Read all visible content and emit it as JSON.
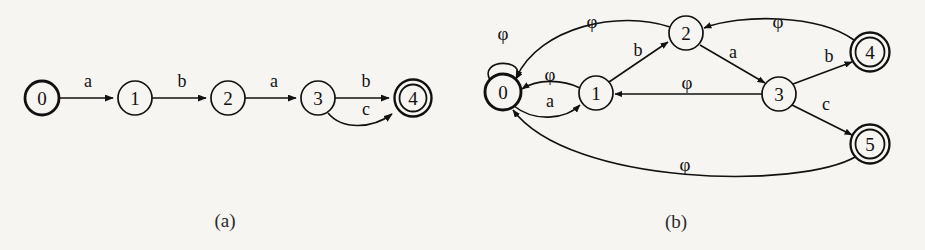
{
  "figure": {
    "background_color": "#f6f5f1",
    "ink_color": "#111111",
    "captions": [
      {
        "id": "caption-a",
        "text": "(a)",
        "x": 225,
        "y": 220
      },
      {
        "id": "caption-b",
        "text": "(b)",
        "x": 676,
        "y": 221
      }
    ]
  },
  "diagram_a": {
    "name": "nfa-chain-a",
    "caption": "(a)",
    "states": [
      {
        "id": "a0",
        "label": "0",
        "x": 42,
        "y": 98,
        "r": 17,
        "accepting": false,
        "start": true,
        "bold": true
      },
      {
        "id": "a1",
        "label": "1",
        "x": 135,
        "y": 98,
        "r": 17,
        "accepting": false,
        "start": false,
        "bold": false
      },
      {
        "id": "a2",
        "label": "2",
        "x": 228,
        "y": 98,
        "r": 17,
        "accepting": false,
        "start": false,
        "bold": false
      },
      {
        "id": "a3",
        "label": "3",
        "x": 318,
        "y": 98,
        "r": 17,
        "accepting": false,
        "start": false,
        "bold": false
      },
      {
        "id": "a4",
        "label": "4",
        "x": 413,
        "y": 98,
        "r": 17,
        "accepting": true,
        "start": false,
        "bold": true
      }
    ],
    "transitions": [
      {
        "id": "a-0-1",
        "from": "0",
        "to": "1",
        "symbol": "a",
        "label_x": 88,
        "label_y": 81
      },
      {
        "id": "a-1-2",
        "from": "1",
        "to": "2",
        "symbol": "b",
        "label_x": 182,
        "label_y": 81
      },
      {
        "id": "a-2-3",
        "from": "2",
        "to": "3",
        "symbol": "a",
        "label_x": 274,
        "label_y": 81
      },
      {
        "id": "a-3-4",
        "from": "3",
        "to": "4",
        "symbol": "b",
        "label_x": 366,
        "label_y": 81
      },
      {
        "id": "a-3-4-c",
        "from": "3",
        "to": "4",
        "symbol": "c",
        "label_x": 366,
        "label_y": 109
      }
    ]
  },
  "diagram_b": {
    "name": "nfa-epsilon-b",
    "caption": "(b)",
    "epsilon_symbol": "φ",
    "states": [
      {
        "id": "b0",
        "label": "0",
        "x": 503,
        "y": 92,
        "r": 18,
        "accepting": false,
        "start": true,
        "bold": true
      },
      {
        "id": "b1",
        "label": "1",
        "x": 596,
        "y": 93,
        "r": 17,
        "accepting": false,
        "start": false,
        "bold": false
      },
      {
        "id": "b2",
        "label": "2",
        "x": 686,
        "y": 33,
        "r": 17,
        "accepting": false,
        "start": false,
        "bold": false
      },
      {
        "id": "b3",
        "label": "3",
        "x": 779,
        "y": 94,
        "r": 17,
        "accepting": false,
        "start": false,
        "bold": false
      },
      {
        "id": "b4",
        "label": "4",
        "x": 870,
        "y": 52,
        "r": 18,
        "accepting": true,
        "start": false,
        "bold": true
      },
      {
        "id": "b5",
        "label": "5",
        "x": 870,
        "y": 144,
        "r": 18,
        "accepting": true,
        "start": false,
        "bold": true
      }
    ],
    "transitions": [
      {
        "id": "b-0-0",
        "from": "0",
        "to": "0",
        "symbol": "φ",
        "label_x": 503,
        "label_y": 33,
        "kind": "self-loop"
      },
      {
        "id": "b-0-1",
        "from": "0",
        "to": "1",
        "symbol": "a",
        "label_x": 550,
        "label_y": 101,
        "kind": "arc-below"
      },
      {
        "id": "b-1-0",
        "from": "1",
        "to": "0",
        "symbol": "φ",
        "label_x": 550,
        "label_y": 74,
        "kind": "arc-above"
      },
      {
        "id": "b-1-2",
        "from": "1",
        "to": "2",
        "symbol": "b",
        "label_x": 638,
        "label_y": 50,
        "kind": "straight"
      },
      {
        "id": "b-2-0",
        "from": "2",
        "to": "0",
        "symbol": "φ",
        "label_x": 592,
        "label_y": 21,
        "kind": "long-arc"
      },
      {
        "id": "b-2-3",
        "from": "2",
        "to": "3",
        "symbol": "a",
        "label_x": 733,
        "label_y": 52,
        "kind": "straight"
      },
      {
        "id": "b-3-1",
        "from": "3",
        "to": "1",
        "symbol": "φ",
        "label_x": 687,
        "label_y": 82,
        "kind": "straight"
      },
      {
        "id": "b-3-4",
        "from": "3",
        "to": "4",
        "symbol": "b",
        "label_x": 829,
        "label_y": 56,
        "kind": "straight"
      },
      {
        "id": "b-3-5",
        "from": "3",
        "to": "5",
        "symbol": "c",
        "label_x": 826,
        "label_y": 104,
        "kind": "straight"
      },
      {
        "id": "b-4-2",
        "from": "4",
        "to": "2",
        "symbol": "φ",
        "label_x": 778,
        "label_y": 21,
        "kind": "long-arc"
      },
      {
        "id": "b-5-0",
        "from": "5",
        "to": "0",
        "symbol": "φ",
        "label_x": 685,
        "label_y": 164,
        "kind": "long-arc"
      }
    ]
  }
}
